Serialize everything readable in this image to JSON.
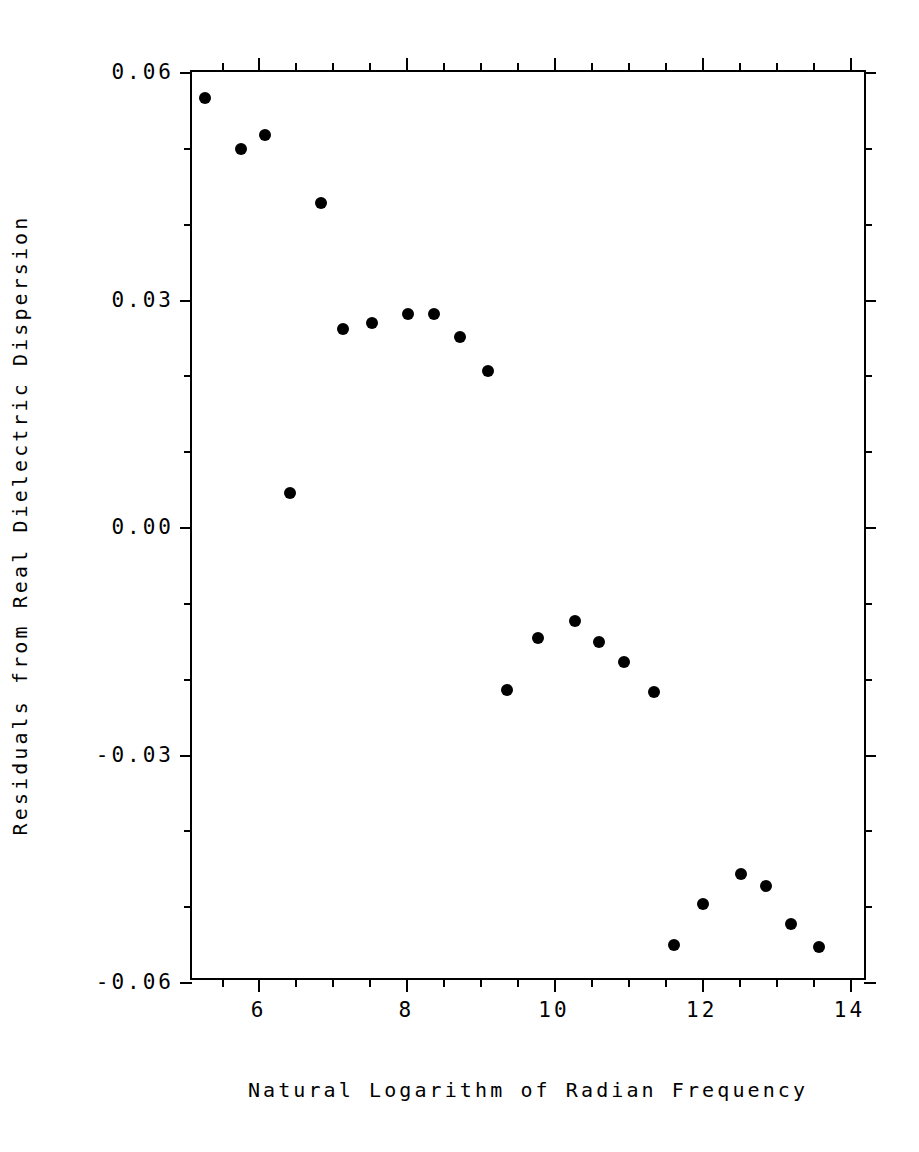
{
  "chart_data": {
    "type": "scatter",
    "title": "",
    "xlabel": "Natural Logarithm of Radian Frequency",
    "ylabel": "Residuals from Real Dielectric Dispersion",
    "xlim": [
      5.1,
      14.25
    ],
    "ylim": [
      -0.06,
      0.06
    ],
    "xticks": [
      6,
      8,
      10,
      12,
      14
    ],
    "xticklabels": [
      "6",
      "8",
      "10",
      "12",
      "14"
    ],
    "yticks": [
      -0.06,
      -0.03,
      0.0,
      0.03,
      0.06
    ],
    "yticklabels": [
      "-0.06",
      "-0.03",
      "0.00",
      "0.03",
      "0.06"
    ],
    "x_minor_ticks_between": 3,
    "y_minor_ticks_between": 2,
    "grid": false,
    "legend": null,
    "marker": "filled-circle",
    "marker_color": "#000000",
    "points": [
      {
        "x": 5.28,
        "y": 0.0566
      },
      {
        "x": 5.76,
        "y": 0.0498
      },
      {
        "x": 6.09,
        "y": 0.0517
      },
      {
        "x": 6.84,
        "y": 0.0427
      },
      {
        "x": 6.43,
        "y": 0.0045
      },
      {
        "x": 7.14,
        "y": 0.0261
      },
      {
        "x": 7.53,
        "y": 0.0269
      },
      {
        "x": 8.02,
        "y": 0.0281
      },
      {
        "x": 8.38,
        "y": 0.0281
      },
      {
        "x": 8.73,
        "y": 0.0251
      },
      {
        "x": 9.1,
        "y": 0.0206
      },
      {
        "x": 9.36,
        "y": -0.0215
      },
      {
        "x": 9.79,
        "y": -0.0147
      },
      {
        "x": 10.29,
        "y": -0.0124
      },
      {
        "x": 10.61,
        "y": -0.0151
      },
      {
        "x": 10.95,
        "y": -0.0178
      },
      {
        "x": 11.35,
        "y": -0.0218
      },
      {
        "x": 11.62,
        "y": -0.0551
      },
      {
        "x": 12.02,
        "y": -0.0497
      },
      {
        "x": 12.53,
        "y": -0.0457
      },
      {
        "x": 12.87,
        "y": -0.0473
      },
      {
        "x": 13.21,
        "y": -0.0524
      },
      {
        "x": 13.58,
        "y": -0.0554
      }
    ]
  },
  "axis": {
    "x_tick_labels": [
      {
        "value": 6,
        "text": "6"
      },
      {
        "value": 8,
        "text": "8"
      },
      {
        "value": 10,
        "text": "10"
      },
      {
        "value": 12,
        "text": "12"
      },
      {
        "value": 14,
        "text": "14"
      }
    ],
    "y_tick_labels": [
      {
        "value": 0.06,
        "text": "0.06"
      },
      {
        "value": 0.03,
        "text": "0.03"
      },
      {
        "value": 0.0,
        "text": "0.00"
      },
      {
        "value": -0.03,
        "text": "-0.03"
      },
      {
        "value": -0.06,
        "text": "-0.06"
      }
    ]
  },
  "titles": {
    "x_axis": "Natural Logarithm of Radian Frequency",
    "y_axis": "Residuals from Real Dielectric Dispersion"
  },
  "colors": {
    "background": "#ffffff",
    "foreground": "#000000",
    "marker": "#000000"
  }
}
